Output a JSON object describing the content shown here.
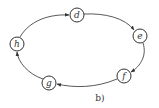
{
  "diagram": {
    "caption": "b)",
    "nodes": [
      {
        "id": "d",
        "label": "d",
        "x": 77,
        "y": 15
      },
      {
        "id": "e",
        "label": "e",
        "x": 140,
        "y": 36
      },
      {
        "id": "f",
        "label": "f",
        "x": 124,
        "y": 76
      },
      {
        "id": "g",
        "label": "g",
        "x": 49,
        "y": 83
      },
      {
        "id": "h",
        "label": "h",
        "x": 17,
        "y": 44
      }
    ],
    "edges": [
      {
        "from": "h",
        "to": "d"
      },
      {
        "from": "d",
        "to": "e"
      },
      {
        "from": "e",
        "to": "f"
      },
      {
        "from": "f",
        "to": "g"
      },
      {
        "from": "g",
        "to": "h"
      }
    ],
    "colors": {
      "stroke": "#444444",
      "background": "#ffffff"
    }
  }
}
